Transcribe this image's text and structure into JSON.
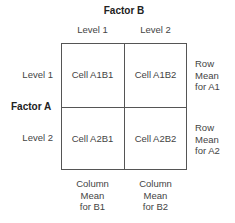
{
  "factor_b": {
    "title": "Factor B",
    "levels": [
      "Level 1",
      "Level 2"
    ]
  },
  "factor_a": {
    "title": "Factor A",
    "levels": [
      "Level 1",
      "Level 2"
    ]
  },
  "cells": [
    [
      "Cell A1B1",
      "Cell A1B2"
    ],
    [
      "Cell A2B1",
      "Cell A2B2"
    ]
  ],
  "row_means": [
    [
      "Row",
      "Mean",
      "for A1"
    ],
    [
      "Row",
      "Mean",
      "for A2"
    ]
  ],
  "column_means": [
    [
      "Column",
      "Mean",
      "for B1"
    ],
    [
      "Column",
      "Mean",
      "for B2"
    ]
  ],
  "colors": {
    "grid_line": "#555555",
    "text": "#444444",
    "heading": "#222222"
  }
}
